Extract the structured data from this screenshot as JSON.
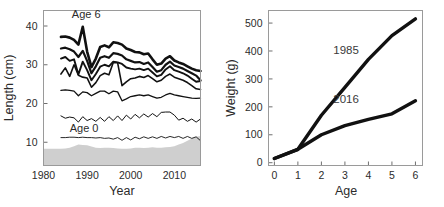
{
  "figure": {
    "panels": [
      "length-at-age-timeseries",
      "weight-at-age-growth"
    ]
  },
  "chart_data": [
    {
      "id": "left",
      "type": "line",
      "title": "",
      "xlabel": "Year",
      "ylabel": "Length (cm)",
      "xlim": [
        1980,
        2016
      ],
      "ylim": [
        4,
        44
      ],
      "xticks": [
        1980,
        1990,
        2000,
        2010
      ],
      "xticklabels": [
        "1980",
        "1990",
        "2000",
        "2010"
      ],
      "yticks": [
        10,
        20,
        30,
        40
      ],
      "yticklabels": [
        "10",
        "20",
        "30",
        "40"
      ],
      "grid": false,
      "legend_position": "none",
      "annotations": [
        {
          "text": "Age 6",
          "x": 1986.5,
          "y": 42.0
        },
        {
          "text": "Age 0",
          "x": 1986.0,
          "y": 12.6
        }
      ],
      "x": [
        1984,
        1985,
        1986,
        1987,
        1988,
        1989,
        1990,
        1991,
        1992,
        1993,
        1994,
        1995,
        1996,
        1997,
        1998,
        1999,
        2000,
        2001,
        2002,
        2003,
        2004,
        2005,
        2006,
        2007,
        2008,
        2009,
        2010,
        2011,
        2012,
        2013,
        2014,
        2015,
        2016
      ],
      "series": [
        {
          "name": "Age 6",
          "linewidth": 2.6,
          "values": [
            37.2,
            37.3,
            37.0,
            36.4,
            35.2,
            39.8,
            33.4,
            29.4,
            31.6,
            34.6,
            35.0,
            34.5,
            35.8,
            35.6,
            35.2,
            34.2,
            33.8,
            33.3,
            33.2,
            32.7,
            32.9,
            31.4,
            30.0,
            30.3,
            31.6,
            32.2,
            31.1,
            30.6,
            30.2,
            29.6,
            29.0,
            28.6,
            28.4
          ]
        },
        {
          "name": "Age 5",
          "linewidth": 2.2,
          "values": [
            34.2,
            34.4,
            34.0,
            33.4,
            32.0,
            33.6,
            31.0,
            27.8,
            29.6,
            31.8,
            32.2,
            31.8,
            33.0,
            32.8,
            32.4,
            31.4,
            31.0,
            30.6,
            30.7,
            30.2,
            30.6,
            29.4,
            28.2,
            28.6,
            30.0,
            30.8,
            29.8,
            29.4,
            29.0,
            28.4,
            27.8,
            27.2,
            26.0
          ]
        },
        {
          "name": "Age 4",
          "linewidth": 1.9,
          "values": [
            31.6,
            32.0,
            31.0,
            31.4,
            27.5,
            30.8,
            28.6,
            26.0,
            27.6,
            29.5,
            30.0,
            29.6,
            30.8,
            30.6,
            30.2,
            29.3,
            29.0,
            28.8,
            29.0,
            28.6,
            29.0,
            28.0,
            27.0,
            27.4,
            28.8,
            29.6,
            28.6,
            28.2,
            27.8,
            27.2,
            26.4,
            25.6,
            25.8
          ]
        },
        {
          "name": "Age 3",
          "linewidth": 1.6,
          "values": [
            27.6,
            29.2,
            27.0,
            30.0,
            27.3,
            26.8,
            26.6,
            24.2,
            25.4,
            27.2,
            27.8,
            27.4,
            30.6,
            30.5,
            24.6,
            25.6,
            26.4,
            26.6,
            27.0,
            26.7,
            27.2,
            26.4,
            25.6,
            26.0,
            27.0,
            27.6,
            26.8,
            26.4,
            26.0,
            25.4,
            24.6,
            23.8,
            23.6
          ]
        },
        {
          "name": "Age 2",
          "linewidth": 1.3,
          "values": [
            23.4,
            23.5,
            23.4,
            23.2,
            22.0,
            23.0,
            22.8,
            22.0,
            22.6,
            23.2,
            23.2,
            22.5,
            23.2,
            23.0,
            20.7,
            21.2,
            21.8,
            22.0,
            22.2,
            22.0,
            22.2,
            21.8,
            21.4,
            21.6,
            22.2,
            22.6,
            22.2,
            22.0,
            21.8,
            21.6,
            21.4,
            21.3,
            21.4
          ]
        },
        {
          "name": "Age 1",
          "linewidth": 1.0,
          "values": [
            16.8,
            16.2,
            16.5,
            16.3,
            15.2,
            16.6,
            15.6,
            16.1,
            15.4,
            16.4,
            15.4,
            16.6,
            15.6,
            16.8,
            15.6,
            17.0,
            16.0,
            17.2,
            16.3,
            17.3,
            16.5,
            17.4,
            16.6,
            17.7,
            17.8,
            17.8,
            17.0,
            15.7,
            16.2,
            15.4,
            16.0,
            15.2,
            16.0
          ]
        },
        {
          "name": "Age 0",
          "linewidth": 0.9,
          "values": [
            11.2,
            11.2,
            11.3,
            11.3,
            11.2,
            11.3,
            11.2,
            11.2,
            11.1,
            11.2,
            11.0,
            11.1,
            10.8,
            11.2,
            10.5,
            11.2,
            10.6,
            11.3,
            10.9,
            11.4,
            11.0,
            11.4,
            11.0,
            11.5,
            11.1,
            11.5,
            11.2,
            11.5,
            11.0,
            11.5,
            11.0,
            11.4,
            10.4
          ]
        }
      ],
      "shaded_band": {
        "name": "background-shading",
        "color": "#cfcfcf",
        "upper": [
          8.3,
          8.4,
          8.6,
          9.0,
          9.4,
          9.3,
          9.2,
          8.9,
          8.6,
          8.5,
          8.6,
          8.6,
          8.5,
          8.4,
          8.3,
          8.3,
          8.4,
          8.6,
          8.6,
          8.5,
          8.6,
          8.7,
          8.6,
          8.6,
          8.7,
          8.8,
          9.0,
          9.4,
          9.8,
          10.4,
          11.0,
          11.4,
          11.6
        ],
        "lower": 4
      }
    },
    {
      "id": "right",
      "type": "line",
      "title": "",
      "xlabel": "Age",
      "ylabel": "Weight (g)",
      "xlim": [
        -0.25,
        6.3
      ],
      "ylim": [
        -10,
        545
      ],
      "xticks": [
        0,
        1,
        2,
        3,
        4,
        5,
        6
      ],
      "xticklabels": [
        "0",
        "1",
        "2",
        "3",
        "4",
        "5",
        "6"
      ],
      "yticks": [
        0,
        100,
        200,
        300,
        400,
        500
      ],
      "yticklabels": [
        "0",
        "100",
        "200",
        "300",
        "400",
        "500"
      ],
      "grid": false,
      "legend_position": "inline-annotation",
      "x": [
        0,
        1,
        2,
        3,
        4,
        5,
        6
      ],
      "series": [
        {
          "name": "1985",
          "linewidth": 3.4,
          "values": [
            15,
            48,
            170,
            270,
            370,
            455,
            515
          ]
        },
        {
          "name": "2016",
          "linewidth": 3.4,
          "values": [
            15,
            48,
            100,
            133,
            155,
            175,
            222
          ]
        }
      ],
      "annotations": [
        {
          "text": "1985",
          "x": 3.05,
          "y": 388
        },
        {
          "text": "2016",
          "x": 3.05,
          "y": 215
        }
      ]
    }
  ]
}
